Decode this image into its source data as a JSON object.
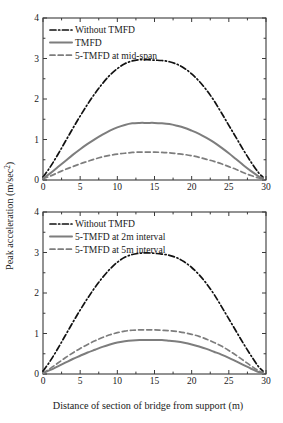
{
  "figure": {
    "xlabel": "Distance of section of bridge from support (m)",
    "ylabel": "Peak acceleration (m/sec²)",
    "ylabel_main": "Peak acceleration (m/sec",
    "ylabel_sup": "2",
    "ylabel_tail": ")",
    "background": "#ffffff"
  },
  "chart_data": [
    {
      "type": "line",
      "panel": "top",
      "title": "",
      "xlabel": "Distance of section of bridge from support (m)",
      "ylabel": "Peak acceleration (m/sec²)",
      "xlim": [
        0,
        30
      ],
      "ylim": [
        0,
        4
      ],
      "xticks": [
        0,
        5,
        10,
        15,
        20,
        25,
        30
      ],
      "yticks": [
        0,
        1,
        2,
        3,
        4
      ],
      "xtick_labels": [
        "0",
        "5",
        "10",
        "15",
        "20",
        "25",
        "30"
      ],
      "ytick_labels": [
        "0",
        "1",
        "2",
        "3",
        "4"
      ],
      "grid": false,
      "legend_position": "upper-left",
      "series": [
        {
          "name": "Without TMFD",
          "color": "#111111",
          "style": "dashdot",
          "width": 1.7,
          "peak": 2.97,
          "peak_x": 15.2,
          "x": [
            0,
            1,
            2,
            3,
            4,
            5,
            6,
            7,
            8,
            9,
            10,
            11,
            12,
            13,
            14,
            15,
            16,
            17,
            18,
            19,
            20,
            21,
            22,
            23,
            24,
            25,
            26,
            27,
            28,
            29,
            29.6
          ],
          "values": [
            0.07,
            0.33,
            0.63,
            0.95,
            1.27,
            1.58,
            1.87,
            2.14,
            2.38,
            2.59,
            2.75,
            2.87,
            2.94,
            2.97,
            2.97,
            2.96,
            2.95,
            2.92,
            2.86,
            2.76,
            2.62,
            2.44,
            2.22,
            1.96,
            1.66,
            1.35,
            1.04,
            0.73,
            0.44,
            0.18,
            0.07
          ]
        },
        {
          "name": "TMFD",
          "color": "#7d7d7d",
          "style": "solid",
          "width": 2.0,
          "peak": 1.41,
          "peak_x": 15.0,
          "x": [
            0,
            1,
            2,
            3,
            4,
            5,
            6,
            7,
            8,
            9,
            10,
            11,
            12,
            13,
            14,
            15,
            16,
            17,
            18,
            19,
            20,
            21,
            22,
            23,
            24,
            25,
            26,
            27,
            28,
            29,
            29.6
          ],
          "values": [
            0.04,
            0.17,
            0.32,
            0.47,
            0.62,
            0.76,
            0.89,
            1.01,
            1.12,
            1.22,
            1.3,
            1.36,
            1.4,
            1.41,
            1.41,
            1.41,
            1.4,
            1.38,
            1.34,
            1.29,
            1.22,
            1.14,
            1.04,
            0.93,
            0.8,
            0.66,
            0.51,
            0.36,
            0.22,
            0.09,
            0.04
          ]
        },
        {
          "name": "5-TMFD at mid-span",
          "color": "#7d7d7d",
          "style": "dashed",
          "width": 1.7,
          "peak": 0.69,
          "peak_x": 14.5,
          "x": [
            0,
            1,
            2,
            3,
            4,
            5,
            6,
            7,
            8,
            9,
            10,
            11,
            12,
            13,
            14,
            15,
            16,
            17,
            18,
            19,
            20,
            21,
            22,
            23,
            24,
            25,
            26,
            27,
            28,
            29,
            29.6
          ],
          "values": [
            0.03,
            0.1,
            0.18,
            0.26,
            0.33,
            0.4,
            0.46,
            0.52,
            0.57,
            0.61,
            0.64,
            0.66,
            0.68,
            0.69,
            0.69,
            0.69,
            0.68,
            0.67,
            0.65,
            0.63,
            0.6,
            0.56,
            0.51,
            0.46,
            0.4,
            0.33,
            0.26,
            0.18,
            0.11,
            0.05,
            0.02
          ]
        }
      ]
    },
    {
      "type": "line",
      "panel": "bottom",
      "title": "",
      "xlabel": "Distance of section of bridge from support (m)",
      "ylabel": "Peak acceleration (m/sec²)",
      "xlim": [
        0,
        30
      ],
      "ylim": [
        0,
        4
      ],
      "xticks": [
        0,
        5,
        10,
        15,
        20,
        25,
        30
      ],
      "yticks": [
        0,
        1,
        2,
        3,
        4
      ],
      "xtick_labels": [
        "0",
        "5",
        "10",
        "15",
        "20",
        "25",
        "30"
      ],
      "ytick_labels": [
        "0",
        "1",
        "2",
        "3",
        "4"
      ],
      "grid": false,
      "legend_position": "upper-left",
      "series": [
        {
          "name": "Without TMFD",
          "color": "#111111",
          "style": "dashdot",
          "width": 1.7,
          "peak": 2.99,
          "peak_x": 15.2,
          "x": [
            0,
            1,
            2,
            3,
            4,
            5,
            6,
            7,
            8,
            9,
            10,
            11,
            12,
            13,
            14,
            15,
            16,
            17,
            18,
            19,
            20,
            21,
            22,
            23,
            24,
            25,
            26,
            27,
            28,
            29,
            29.6
          ],
          "values": [
            0.07,
            0.33,
            0.63,
            0.95,
            1.27,
            1.58,
            1.87,
            2.14,
            2.38,
            2.59,
            2.76,
            2.88,
            2.95,
            2.98,
            2.99,
            2.98,
            2.96,
            2.93,
            2.87,
            2.77,
            2.63,
            2.45,
            2.23,
            1.97,
            1.67,
            1.36,
            1.05,
            0.74,
            0.45,
            0.18,
            0.07
          ]
        },
        {
          "name": "5-TMFD at 2m interval",
          "color": "#7d7d7d",
          "style": "solid",
          "width": 2.0,
          "peak": 0.84,
          "peak_x": 15.0,
          "x": [
            0,
            1,
            2,
            3,
            4,
            5,
            6,
            7,
            8,
            9,
            10,
            11,
            12,
            13,
            14,
            15,
            16,
            17,
            18,
            19,
            20,
            21,
            22,
            23,
            24,
            25,
            26,
            27,
            28,
            29,
            29.6
          ],
          "values": [
            0.02,
            0.1,
            0.19,
            0.28,
            0.37,
            0.45,
            0.53,
            0.6,
            0.67,
            0.73,
            0.78,
            0.81,
            0.83,
            0.84,
            0.84,
            0.84,
            0.84,
            0.82,
            0.8,
            0.77,
            0.73,
            0.68,
            0.62,
            0.55,
            0.48,
            0.4,
            0.31,
            0.22,
            0.13,
            0.05,
            0.02
          ]
        },
        {
          "name": "5-TMFD at 5m interval",
          "color": "#7d7d7d",
          "style": "dashed",
          "width": 1.7,
          "peak": 1.09,
          "peak_x": 14.0,
          "x": [
            0,
            1,
            2,
            3,
            4,
            5,
            6,
            7,
            8,
            9,
            10,
            11,
            12,
            13,
            14,
            15,
            16,
            17,
            18,
            19,
            20,
            21,
            22,
            23,
            24,
            25,
            26,
            27,
            28,
            29,
            29.6
          ],
          "values": [
            0.02,
            0.14,
            0.27,
            0.4,
            0.52,
            0.63,
            0.73,
            0.82,
            0.9,
            0.97,
            1.02,
            1.06,
            1.08,
            1.09,
            1.09,
            1.09,
            1.08,
            1.07,
            1.05,
            1.02,
            0.98,
            0.93,
            0.86,
            0.78,
            0.69,
            0.58,
            0.46,
            0.33,
            0.2,
            0.08,
            0.03
          ]
        }
      ]
    }
  ]
}
